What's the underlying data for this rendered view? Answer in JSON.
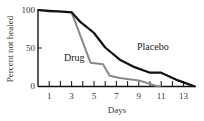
{
  "chart_data": {
    "type": "line",
    "title": "",
    "xlabel": "Days",
    "ylabel": "Percent not healed",
    "xlim": [
      0,
      14
    ],
    "ylim": [
      0,
      100
    ],
    "x_ticks": [
      1,
      2,
      3,
      4,
      5,
      6,
      7,
      8,
      9,
      10,
      11,
      12,
      13,
      14
    ],
    "x_tick_labels": [
      "1",
      "3",
      "5",
      "7",
      "9",
      "11",
      "13"
    ],
    "x_tick_label_values": [
      1,
      3,
      5,
      7,
      9,
      11,
      13
    ],
    "y_ticks": [
      0,
      50,
      100
    ],
    "y_tick_labels": [
      "0",
      "50",
      "100"
    ],
    "grid": false,
    "legend": "inline labels",
    "series": [
      {
        "name": "Placebo",
        "color": "#111111",
        "points": [
          [
            0,
            100
          ],
          [
            1,
            99
          ],
          [
            2,
            98
          ],
          [
            3,
            97
          ],
          [
            3.8,
            84
          ],
          [
            4.5,
            76
          ],
          [
            5,
            70
          ],
          [
            6,
            51
          ],
          [
            7.3,
            35
          ],
          [
            8.5,
            26
          ],
          [
            10,
            18
          ],
          [
            11,
            18
          ],
          [
            12.5,
            8
          ],
          [
            14,
            0
          ]
        ]
      },
      {
        "name": "Drug",
        "color": "#888888",
        "points": [
          [
            0,
            100
          ],
          [
            1,
            98
          ],
          [
            2,
            98
          ],
          [
            3,
            97
          ],
          [
            4.7,
            31
          ],
          [
            5.8,
            29
          ],
          [
            6.4,
            14
          ],
          [
            7.3,
            11
          ],
          [
            9,
            8
          ],
          [
            10.5,
            1
          ],
          [
            11,
            0
          ]
        ]
      }
    ]
  },
  "labels": {
    "placebo": "Placebo",
    "drug": "Drug",
    "xlabel": "Days",
    "ylabel": "Percent not healed",
    "y100": "100",
    "y50": "50",
    "y0": "0",
    "x1": "1",
    "x3": "3",
    "x5": "5",
    "x7": "7",
    "x9": "9",
    "x11": "11",
    "x13": "13"
  }
}
